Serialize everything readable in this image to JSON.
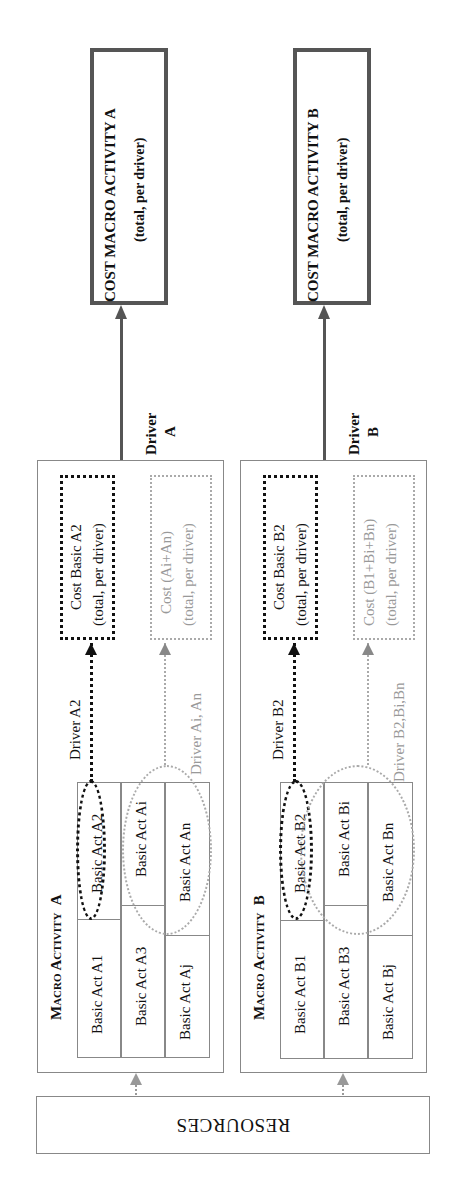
{
  "macro_a": {
    "title_prefix": "Macro Activity",
    "title_letter": "A",
    "cost_box": {
      "line1": "COST  MACRO ACTIVITY A",
      "line2": "(total, per driver)"
    },
    "driver_label_line1": "Driver",
    "driver_label_line2": "A",
    "basic_acts": {
      "row1": [
        "Basic Act A1",
        "Basic Act A2"
      ],
      "row2": [
        "Basic Act A3",
        "Basic Act Ai"
      ],
      "row3": [
        "Basic Act Aj",
        "Basic Act An"
      ]
    },
    "primary_driver": "Driver A2",
    "primary_cost": {
      "line1": "Cost  Basic A2",
      "line2": "(total, per driver)"
    },
    "secondary_driver": "Driver Ai, An",
    "secondary_cost": {
      "line1": "Cost (Ai+An)",
      "line2": "(total, per driver)"
    }
  },
  "macro_b": {
    "title_prefix": "Macro Activity",
    "title_letter": "B",
    "cost_box": {
      "line1": "COST  MACRO ACTIVITY B",
      "line2": "(total, per driver)"
    },
    "driver_label_line1": "Driver",
    "driver_label_line2": "B",
    "basic_acts": {
      "row1": [
        "Basic Act B1",
        "Basic Act B2"
      ],
      "row2": [
        "Basic Act B3",
        "Basic Act Bi"
      ],
      "row3": [
        "Basic Act Bj",
        "Basic Act Bn"
      ]
    },
    "primary_driver": "Driver B2",
    "primary_cost": {
      "line1": "Cost Basic B2",
      "line2": "(total, per driver)"
    },
    "secondary_driver": "Driver B2,Bi,Bn",
    "secondary_cost": {
      "line1": "Cost (B1+Bi+Bn)",
      "line2": "(total, per driver)"
    }
  },
  "resources": {
    "label": "RESOURCES"
  },
  "colors": {
    "primary_line": "#111111",
    "secondary_line": "#aaaaaa",
    "cost_border": "#555555",
    "box_border": "#888888"
  }
}
